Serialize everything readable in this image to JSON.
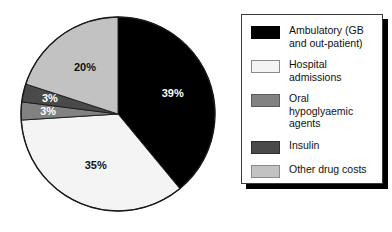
{
  "chart_data": {
    "type": "pie",
    "title": "",
    "categories": [
      "Ambulatory (GB and out-patient)",
      "Hospital admissions",
      "Oral hypoglyaemic agents",
      "Insulin",
      "Other drug costs"
    ],
    "values": [
      39,
      35,
      3,
      3,
      20
    ],
    "value_labels": [
      "39%",
      "35%",
      "3%",
      "3%",
      "20%"
    ],
    "unit": "%",
    "start_angle_deg": 0,
    "direction": "clockwise",
    "grid": false,
    "legend_position": "right",
    "colors": [
      "#000000",
      "#f4f4f4",
      "#828282",
      "#4a4a4a",
      "#c2c2c2"
    ],
    "label_colors": [
      "#ffffff",
      "#111111",
      "#ffffff",
      "#ffffff",
      "#111111"
    ]
  },
  "pie": {
    "label_39": "39%",
    "label_35": "35%",
    "label_20": "20%",
    "label_insulin": "3%",
    "label_oral": "3%"
  },
  "legend": {
    "items": [
      {
        "label": "Ambulatory (GB\nand out-patient)",
        "color": "#000000",
        "border": "#000000"
      },
      {
        "label": "Hospital admissions",
        "color": "#f4f4f4",
        "border": "#8a8a8a"
      },
      {
        "label": "Oral hypoglyaemic\nagents",
        "color": "#828282",
        "border": "#5a5a5a"
      },
      {
        "label": "Insulin",
        "color": "#4a4a4a",
        "border": "#2e2e2e"
      },
      {
        "label": "Other drug costs",
        "color": "#c2c2c2",
        "border": "#8a8a8a"
      }
    ]
  }
}
